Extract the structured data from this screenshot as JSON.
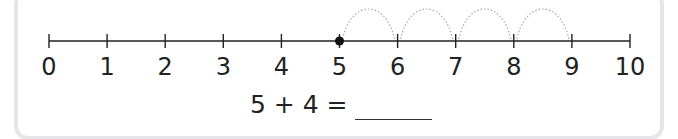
{
  "number_line": {
    "min": 0,
    "max": 10,
    "labels": [
      "0",
      "1",
      "2",
      "3",
      "4",
      "5",
      "6",
      "7",
      "8",
      "9",
      "10"
    ],
    "start_point": 5,
    "jumps": 4,
    "jump_size": 1,
    "line_color": "#222222",
    "arc_color": "#a8a8a8"
  },
  "equation": {
    "text": "5 + 4 =",
    "answer": ""
  }
}
